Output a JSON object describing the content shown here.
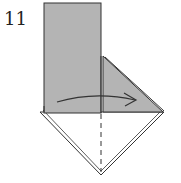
{
  "diagram": {
    "step_number": "11",
    "colors": {
      "paper_colored": "#b4b4b4",
      "paper_white": "#ffffff",
      "line": "#333333"
    },
    "elements": {
      "arrow": "curved fold arrow pointing right",
      "valley_fold_line": "dashed vertical center line"
    }
  }
}
